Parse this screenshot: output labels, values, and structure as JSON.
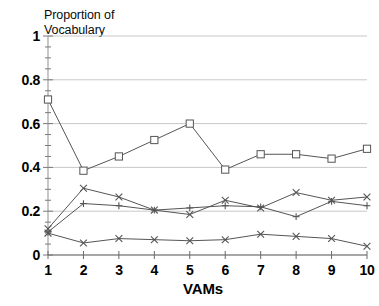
{
  "chart_data": {
    "type": "line",
    "title": "Proportion of\nVocabulary",
    "xlabel": "VAMs",
    "ylabel": "",
    "x": [
      1,
      2,
      3,
      4,
      5,
      6,
      7,
      8,
      9,
      10
    ],
    "xticklabels": [
      "1",
      "2",
      "3",
      "4",
      "5",
      "6",
      "7",
      "8",
      "9",
      "10"
    ],
    "yticks": [
      0,
      0.2,
      0.4,
      0.6,
      0.8,
      1
    ],
    "yticklabels": [
      "0",
      "0.2",
      "0.4",
      "0.6",
      "0.8",
      "1"
    ],
    "xlim": [
      1,
      10
    ],
    "ylim": [
      0,
      1
    ],
    "grid": true,
    "grid_color": "#c8c8c8",
    "legend": null,
    "line_color": "#555555",
    "series": [
      {
        "name": "series-square",
        "marker": "square",
        "values": [
          0.71,
          0.385,
          0.45,
          0.525,
          0.6,
          0.39,
          0.46,
          0.46,
          0.44,
          0.485
        ]
      },
      {
        "name": "series-cross-upper",
        "marker": "cross",
        "values": [
          0.12,
          0.305,
          0.265,
          0.205,
          0.185,
          0.25,
          0.215,
          0.285,
          0.25,
          0.265
        ]
      },
      {
        "name": "series-plus-middle",
        "marker": "plus",
        "values": [
          0.105,
          0.235,
          0.225,
          0.205,
          0.215,
          0.225,
          0.22,
          0.175,
          0.245,
          0.225
        ]
      },
      {
        "name": "series-cross-lower",
        "marker": "cross",
        "values": [
          0.1,
          0.055,
          0.075,
          0.07,
          0.065,
          0.07,
          0.095,
          0.085,
          0.075,
          0.04
        ]
      }
    ]
  }
}
